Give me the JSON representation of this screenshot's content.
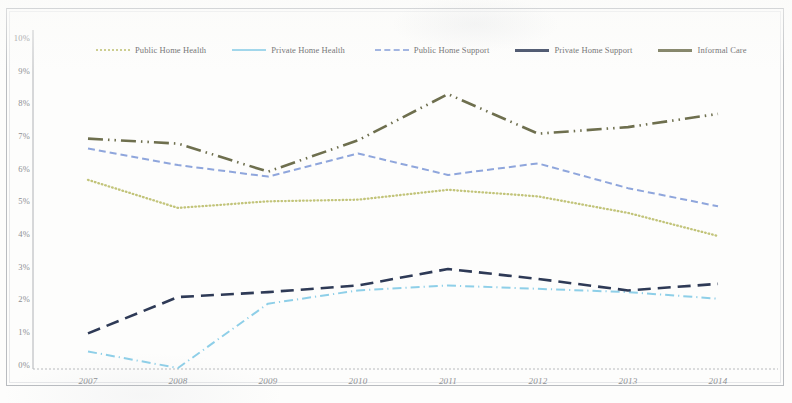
{
  "chart_data": {
    "type": "line",
    "title": "",
    "subtitle": "",
    "xlabel": "",
    "ylabel": "",
    "x": [
      "2007",
      "2008",
      "2009",
      "2010",
      "2011",
      "2012",
      "2013",
      "2014"
    ],
    "xtick_labels": [
      "2007",
      "2008",
      "2009",
      "2010",
      "2011",
      "2012",
      "2013",
      "2014"
    ],
    "ytick_labels": [
      "10%",
      "9%",
      "8%",
      "7%",
      "6%",
      "5%",
      "4%",
      "3%",
      "2%",
      "1%",
      "0%"
    ],
    "ytick_values": [
      10,
      9,
      8,
      7,
      6,
      5,
      4,
      3,
      2,
      1,
      0
    ],
    "ylim": [
      0,
      10
    ],
    "grid": false,
    "legend_position": "top",
    "value_suffix": "%",
    "series": [
      {
        "name": "Public Home Health",
        "color": "#c2c47a",
        "style": "dotted",
        "values": [
          5.7,
          4.85,
          5.05,
          5.1,
          5.4,
          5.2,
          4.7,
          4.0
        ]
      },
      {
        "name": "Private Home Health",
        "color": "#8ecfe8",
        "style": "dash-dot",
        "values": [
          0.5,
          0.0,
          1.95,
          2.35,
          2.5,
          2.4,
          2.3,
          2.1
        ]
      },
      {
        "name": "Public Home Support",
        "color": "#8fa6dc",
        "style": "dashed",
        "values": [
          6.65,
          6.15,
          5.8,
          6.5,
          5.85,
          6.2,
          5.45,
          4.9
        ]
      },
      {
        "name": "Private Home Support",
        "color": "#2e3a56",
        "style": "long-dash",
        "values": [
          1.05,
          2.15,
          2.3,
          2.5,
          3.0,
          2.7,
          2.35,
          2.55
        ]
      },
      {
        "name": "Informal Care",
        "color": "#6e6f4e",
        "style": "dash-dot-dot",
        "values": [
          6.95,
          6.8,
          5.95,
          6.9,
          8.3,
          7.1,
          7.3,
          7.7
        ]
      }
    ]
  },
  "legend": {
    "items": [
      {
        "label": "Public Home Health",
        "color": "#c2c47a",
        "swatch": "dotted"
      },
      {
        "label": "Private Home Health",
        "color": "#8ecfe8",
        "swatch": "solid"
      },
      {
        "label": "Public Home Support",
        "color": "#8fa6dc",
        "swatch": "dashed"
      },
      {
        "label": "Private Home Support",
        "color": "#2e3a56",
        "swatch": "thick"
      },
      {
        "label": "Informal Care",
        "color": "#6e6f4e",
        "swatch": "thick"
      }
    ]
  },
  "axes": {
    "y_labels": [
      "10%",
      "9%",
      "8%",
      "7%",
      "6%",
      "5%",
      "4%",
      "3%",
      "2%",
      "1%",
      "0%"
    ],
    "x_labels": [
      "2007",
      "2008",
      "2009",
      "2010",
      "2011",
      "2012",
      "2013",
      "2014"
    ]
  }
}
